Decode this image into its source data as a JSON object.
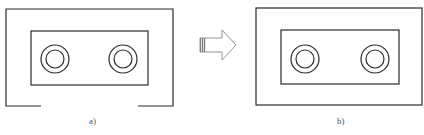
{
  "figure": {
    "stroke_color": "#2a2a2a",
    "arrow_color": "#888888",
    "panels": [
      {
        "id": "a",
        "label": "a)",
        "label_pos": [
          89,
          116
        ],
        "outer_frame": {
          "type": "open-bottom",
          "left": 6,
          "top": 9,
          "right": 173,
          "bottom": 106,
          "gap_from_x": 41,
          "gap_to_x": 138
        },
        "inner_rect": {
          "left": 31,
          "top": 31,
          "right": 148,
          "bottom": 85
        },
        "rings": [
          {
            "cx": 55,
            "cy": 59,
            "r_outer": 14,
            "r_inner": 9
          },
          {
            "cx": 123,
            "cy": 59,
            "r_outer": 14,
            "r_inner": 9
          }
        ]
      },
      {
        "id": "b",
        "label": "b)",
        "label_pos": [
          337,
          116
        ],
        "outer_frame": {
          "type": "closed",
          "left": 256,
          "top": 8,
          "right": 422,
          "bottom": 105
        },
        "inner_rect": {
          "left": 281,
          "top": 30,
          "right": 399,
          "bottom": 84
        },
        "rings": [
          {
            "cx": 305,
            "cy": 59,
            "r_outer": 14,
            "r_inner": 9
          },
          {
            "cx": 375,
            "cy": 59,
            "r_outer": 14,
            "r_inner": 9
          }
        ]
      }
    ],
    "arrow": {
      "direction": "right",
      "tail_x": 200,
      "shaft_end_x": 222,
      "tip_x": 236,
      "shaft_top": 38,
      "shaft_bottom": 52,
      "head_top": 30,
      "head_bottom": 60,
      "tip_y": 45
    },
    "caption": ""
  }
}
